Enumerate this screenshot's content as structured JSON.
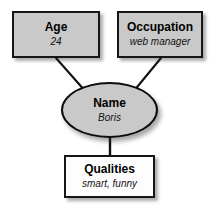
{
  "diagram": {
    "background_color": "#ffffff",
    "edge_color": "#111111",
    "nodes": [
      {
        "id": "age",
        "shape": "rectangle",
        "title": "Age",
        "value": "24",
        "fill": "#c9c9c9",
        "border": "#161616"
      },
      {
        "id": "occupation",
        "shape": "rectangle",
        "title": "Occupation",
        "value": "web manager",
        "fill": "#c9c9c9",
        "border": "#161616"
      },
      {
        "id": "name",
        "shape": "ellipse",
        "title": "Name",
        "value": "Boris",
        "fill": "#c9c9c9",
        "border": "#0d0d0d"
      },
      {
        "id": "qualities",
        "shape": "rectangle",
        "title": "Qualities",
        "value": "smart, funny",
        "fill": "#fdfdfd",
        "border": "#161616"
      }
    ],
    "edges": [
      {
        "from": "age",
        "to": "name"
      },
      {
        "from": "occupation",
        "to": "name"
      },
      {
        "from": "name",
        "to": "qualities"
      }
    ]
  }
}
